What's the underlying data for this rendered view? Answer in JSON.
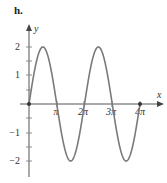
{
  "panel_label": "h.",
  "chart_data": {
    "type": "line",
    "title": "",
    "function": "y = 2 sin(x)",
    "xlabel": "x",
    "ylabel": "y",
    "xlim": [
      0,
      4.6
    ],
    "ylim": [
      -2.5,
      2.5
    ],
    "x_ticks": [
      {
        "value": 1,
        "label": "π"
      },
      {
        "value": 2,
        "label": "2π"
      },
      {
        "value": 3,
        "label": "3π"
      },
      {
        "value": 4,
        "label": "4π"
      }
    ],
    "x_unit": "π",
    "y_ticks": [
      {
        "value": 2,
        "label": "2"
      },
      {
        "value": 1,
        "label": "1"
      },
      {
        "value": -1,
        "label": "−1"
      },
      {
        "value": -2,
        "label": "−2"
      }
    ],
    "y_minor_ticks": [
      1.5,
      0.5,
      -0.5,
      -1.5
    ],
    "series": [
      {
        "name": "2 sin x",
        "x": [
          0,
          0.5,
          1,
          1.5,
          2,
          2.5,
          3,
          3.5,
          4
        ],
        "x_unit": "π",
        "values": [
          0,
          2,
          0,
          -2,
          0,
          2,
          0,
          -2,
          0
        ]
      }
    ],
    "marked_points": [
      {
        "x": 0,
        "y": 0
      },
      {
        "x": 4,
        "y": 0
      }
    ],
    "grid": false,
    "legend": null,
    "color": "#7a7a7a"
  }
}
